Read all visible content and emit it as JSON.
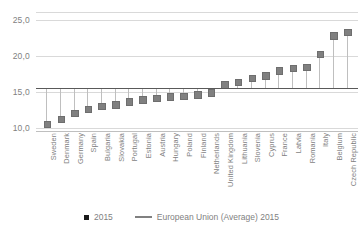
{
  "chart_data": {
    "type": "scatter",
    "title": "",
    "xlabel": "",
    "ylabel": "",
    "ylim": [
      10.0,
      25.0
    ],
    "yticks": [
      "10,0",
      "15,0",
      "20,0",
      "25,0"
    ],
    "ytick_values": [
      10.0,
      15.0,
      20.0,
      25.0
    ],
    "grid": true,
    "legend_position": "bottom",
    "decimal_separator": ",",
    "categories": [
      "Sweden",
      "Denmark",
      "Germany",
      "Spain",
      "Bulgaria",
      "Slovakia",
      "Portugal",
      "Estonia",
      "Austria",
      "Hungary",
      "Poland",
      "Finland",
      "Netherlands",
      "United Kingdom",
      "Lithuania",
      "Slovenia",
      "Cyprus",
      "France",
      "Latvia",
      "Romania",
      "Italy",
      "Belgium",
      "Czech Republic"
    ],
    "series": [
      {
        "name": "2015",
        "marker": "square",
        "color": "#808080",
        "values": [
          10.6,
          11.3,
          12.1,
          12.7,
          13.1,
          13.3,
          13.7,
          14.0,
          14.2,
          14.4,
          14.5,
          14.7,
          15.0,
          16.1,
          16.4,
          17.0,
          17.3,
          18.0,
          18.4,
          18.5,
          20.3,
          22.9,
          23.4
        ]
      },
      {
        "name": "European Union (Average) 2015",
        "type": "reference_line",
        "color": "#595959",
        "value": 15.6
      }
    ]
  },
  "legend": {
    "items": [
      {
        "label": "2015",
        "icon": "square-marker"
      },
      {
        "label": "European Union (Average) 2015",
        "icon": "line-marker"
      }
    ]
  },
  "axis": {
    "y": {
      "ticks": [
        "25,0",
        "20,0",
        "15,0",
        "10,0"
      ]
    }
  }
}
